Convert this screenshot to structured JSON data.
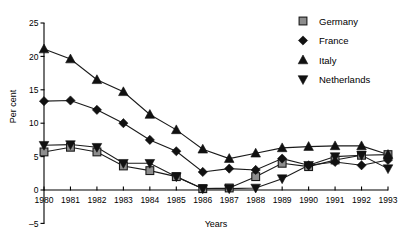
{
  "chart_data": {
    "type": "line",
    "title": "",
    "xlabel": "Years",
    "ylabel": "Per cent",
    "categories": [
      1980,
      1981,
      1982,
      1983,
      1984,
      1985,
      1986,
      1987,
      1988,
      1989,
      1990,
      1991,
      1992,
      1993
    ],
    "x": [
      "1980",
      "1981",
      "1982",
      "1983",
      "1984",
      "1985",
      "1986",
      "1987",
      "1988",
      "1989",
      "1990",
      "1991",
      "1992",
      "1993"
    ],
    "xlim": [
      1980,
      1993
    ],
    "ylim": [
      -5,
      25
    ],
    "yticks": [
      -5,
      0,
      5,
      10,
      15,
      20,
      25
    ],
    "yticklabels": [
      "-5",
      "0",
      "5",
      "10",
      "15",
      "20",
      "25"
    ],
    "grid": false,
    "legend_position": "top-right",
    "series": [
      {
        "name": "Germany",
        "marker": "square",
        "marker_fill": "#8d8d8d",
        "values": [
          5.7,
          6.4,
          5.7,
          3.6,
          2.9,
          2.0,
          0.2,
          0.3,
          2.0,
          4.0,
          3.5,
          4.5,
          5.2,
          5.3
        ]
      },
      {
        "name": "France",
        "marker": "diamond",
        "marker_fill": "#111111",
        "values": [
          13.3,
          13.4,
          12.0,
          10.0,
          7.5,
          5.8,
          2.7,
          3.2,
          3.0,
          4.7,
          3.7,
          4.2,
          3.7,
          4.5
        ]
      },
      {
        "name": "Italy",
        "marker": "triangle-up",
        "marker_fill": "#111111",
        "values": [
          21.1,
          19.6,
          16.5,
          14.7,
          11.3,
          9.0,
          6.1,
          4.7,
          5.5,
          6.3,
          6.5,
          6.6,
          6.6,
          5.3
        ]
      },
      {
        "name": "Netherlands",
        "marker": "triangle-down",
        "marker_fill": "#111111",
        "values": [
          6.7,
          6.8,
          6.4,
          4.0,
          4.0,
          2.0,
          0.2,
          0.2,
          0.3,
          1.7,
          3.7,
          5.0,
          5.2,
          3.2
        ]
      }
    ]
  },
  "legend": {
    "entries": [
      {
        "label": "Germany"
      },
      {
        "label": "France"
      },
      {
        "label": "Italy"
      },
      {
        "label": "Netherlands"
      }
    ]
  },
  "axes": {
    "ylabel": "Per cent",
    "xlabel": "Years"
  }
}
